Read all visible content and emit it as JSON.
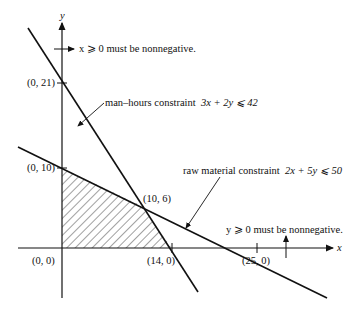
{
  "diagram": {
    "type": "linear-programming-feasible-region",
    "axes": {
      "x_label": "x",
      "y_label": "y"
    },
    "constraints": [
      {
        "name": "man-hours",
        "label": "man–hours constraint",
        "inequality": "3x + 2y ⩽ 42",
        "intercepts": [
          "(0, 21)",
          "(14, 0)"
        ]
      },
      {
        "name": "raw-material",
        "label": "raw material constraint",
        "inequality": "2x + 5y ⩽ 50",
        "intercepts": [
          "(0, 10)",
          "(25, 0)"
        ]
      },
      {
        "name": "x-nonneg",
        "label": "x ⩾ 0 must be nonnegative."
      },
      {
        "name": "y-nonneg",
        "label": "y ⩾ 0 must be nonnegative."
      }
    ],
    "points": {
      "p0_21": "(0, 21)",
      "p0_10": "(0, 10)",
      "p10_6": "(10, 6)",
      "p0_0": "(0, 0)",
      "p14_0": "(14, 0)",
      "p25_0": "(25, 0)"
    },
    "feasible_region": [
      "(0, 0)",
      "(0, 10)",
      "(10, 6)",
      "(14, 0)"
    ]
  },
  "labels": {
    "y_axis": "y",
    "x_axis": "x",
    "x_nonneg": "x ⩾ 0 must be nonnegative.",
    "y_nonneg": "y ⩾ 0 must be nonnegative.",
    "man_hours_text": "man–hours constraint",
    "man_hours_ineq": "3x + 2y ⩽ 42",
    "raw_text": "raw material constraint",
    "raw_ineq": "2x + 5y ⩽ 50"
  },
  "colors": {
    "ink": "#111111",
    "background": "#ffffff"
  }
}
